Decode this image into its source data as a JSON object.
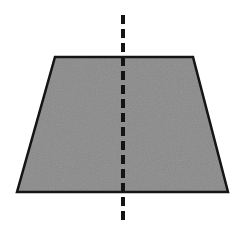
{
  "figure": {
    "canvas": {
      "width": 245,
      "height": 229,
      "background": "#ffffff"
    },
    "shape": {
      "name": "trapezoid",
      "kind": "isosceles-trapezoid",
      "fill": "#8a8a8a",
      "stroke": "#141414",
      "stroke_width": 2.5,
      "points": "55,57 193,57 228,192 17,192",
      "vertices": [
        {
          "label": "top-left",
          "x": 55,
          "y": 57
        },
        {
          "label": "top-right",
          "x": 193,
          "y": 57
        },
        {
          "label": "bottom-right",
          "x": 228,
          "y": 192
        },
        {
          "label": "bottom-left",
          "x": 17,
          "y": 192
        }
      ],
      "top_width": 138,
      "bottom_width": 211,
      "height": 135
    },
    "symmetry_line": {
      "name": "vertical-line-of-symmetry",
      "orientation": "vertical",
      "stroke": "#141414",
      "stroke_width": 4,
      "dash_length": 9,
      "gap_length": 5,
      "x": 123,
      "y_start": 15,
      "y_end": 225
    },
    "texture": {
      "name": "noise-speckle",
      "opacity": 0.16,
      "base_frequency": 0.85
    }
  }
}
